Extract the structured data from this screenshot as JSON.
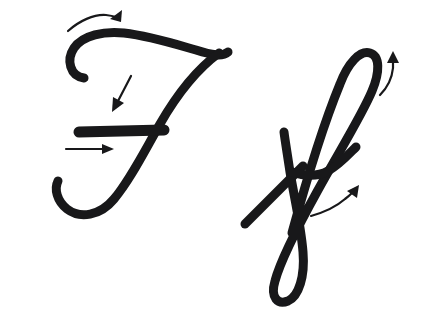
{
  "page": {
    "background_color": "#ffffff",
    "width": 421,
    "height": 312
  },
  "ink": {
    "letter_color": "#18181a",
    "arrow_color": "#18181a",
    "letter_stroke_width": 9,
    "crossbar_stroke_width": 11,
    "arrow_stroke_width": 2.2
  },
  "glyphs": [
    {
      "name": "uppercase-f",
      "label": "F",
      "case": "uppercase",
      "strokes": [
        {
          "name": "top-hook-and-headline",
          "order": 1,
          "width": 9,
          "d": "M 84 78 C 70 76 66 60 74 48 C 83 35 104 31 124 33 C 150 36 175 44 196 50 C 212 55 222 57 228 52"
        },
        {
          "name": "descending-stem-and-bowl",
          "order": 2,
          "width": 9,
          "d": "M 219 53 C 196 70 176 96 160 124 C 144 152 130 180 114 199 C 100 216 80 219 67 209 C 57 201 54 189 58 181"
        },
        {
          "name": "crossbar",
          "order": 3,
          "width": 11,
          "d": "M 79 132 L 164 130"
        }
      ]
    },
    {
      "name": "lowercase-f",
      "label": "f",
      "case": "lowercase",
      "strokes": [
        {
          "name": "ascender-loop-and-descender-loop",
          "order": 1,
          "width": 9,
          "d": "M 292 233 C 304 189 324 123 340 84 C 348 63 360 50 370 53 C 380 56 380 72 372 91 C 362 115 340 150 318 190 C 297 228 280 262 275 281 C 270 298 278 305 288 301 C 299 296 305 276 303 252 C 301 226 294 196 290 172 C 287 152 285 140 284 132"
        },
        {
          "name": "diagonal-tail",
          "order": 2,
          "width": 9,
          "d": "M 245 224 L 303 166"
        },
        {
          "name": "crossbar-sweep",
          "order": 3,
          "width": 9,
          "d": "M 292 172 C 304 176 317 177 328 171 C 339 165 348 155 356 147"
        }
      ]
    }
  ],
  "arrows": [
    {
      "name": "arrow-top-headline",
      "direction": "right",
      "meaning": "start at left hook and sweep right along the headline",
      "target_glyph": "uppercase-f",
      "stroke_order": 1,
      "line_d": "M 68 31 C 79 21 94 14 106 15 C 115 16 119 18 120 20",
      "head_points": "122,10 121,22 110,19"
    },
    {
      "name": "arrow-stem-down",
      "direction": "down-left",
      "meaning": "bring the stem down through the baseline",
      "target_glyph": "uppercase-f",
      "stroke_order": 2,
      "line_d": "M 131 76 L 117 103",
      "head_points": "112,112 113,97 124,103"
    },
    {
      "name": "arrow-crossbar-right",
      "direction": "right",
      "meaning": "draw the crossbar left to right",
      "target_glyph": "uppercase-f",
      "stroke_order": 3,
      "line_d": "M 66 149 L 105 149",
      "head_points": "114,149 102,154 102,144"
    },
    {
      "name": "arrow-ascender-up",
      "direction": "up",
      "meaning": "start low and carry the loop up to the ascender",
      "target_glyph": "lowercase-f",
      "stroke_order": 1,
      "line_d": "M 380 95 C 388 87 392 78 393 68 C 393 64 393 62 393 60",
      "head_points": "393,51 399,63 387,63"
    },
    {
      "name": "arrow-crossbar-sweep-up",
      "direction": "up-right",
      "meaning": "finish with the crossbar sweeping up and to the right",
      "target_glyph": "lowercase-f",
      "stroke_order": 3,
      "line_d": "M 311 216 C 325 212 337 206 345 199 C 349 196 351 194 353 192",
      "head_points": "359,185 357,198 347,191"
    }
  ]
}
